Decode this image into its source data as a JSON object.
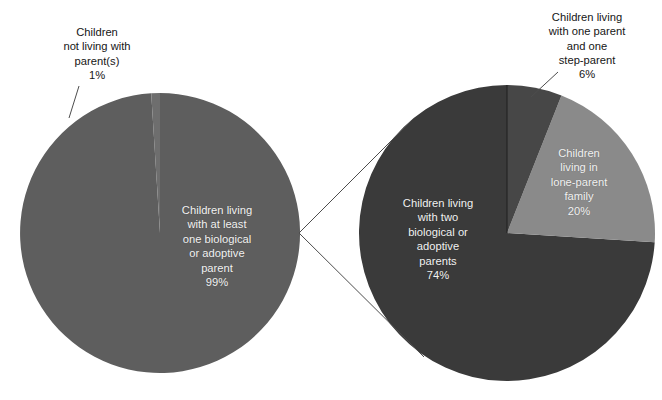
{
  "chart_data": {
    "type": "pie",
    "title": "",
    "subtitle": "",
    "xlabel": "",
    "ylabel": "",
    "legend": "none",
    "grid": false,
    "charts": [
      {
        "name": "left-pie",
        "center": [
          160,
          233
        ],
        "radius": 140,
        "slices": [
          {
            "label": "Children living with at least one biological or adoptive parent",
            "value": 99,
            "value_text": "99%",
            "color": "#5e5e5e",
            "label_position": "inside"
          },
          {
            "label": "Children not living with parent(s)",
            "value": 1,
            "value_text": "1%",
            "color": "#6e6e6e",
            "label_position": "callout"
          }
        ]
      },
      {
        "name": "right-pie",
        "center": [
          507,
          233
        ],
        "radius": 148,
        "slices": [
          {
            "label": "Children living with one parent and one step-parent",
            "value": 6,
            "value_text": "6%",
            "color": "#474747",
            "label_position": "callout"
          },
          {
            "label": "Children living in lone-parent family",
            "value": 20,
            "value_text": "20%",
            "color": "#8a8a8a",
            "label_position": "inside"
          },
          {
            "label": "Children living with two biological or adoptive parents",
            "value": 74,
            "value_text": "74%",
            "color": "#3a3a3a",
            "label_position": "inside"
          }
        ]
      }
    ]
  },
  "callouts": {
    "left_not_living": "Children\nnot living with\nparent(s)\n1%",
    "right_step_parent": "Children living\nwith one parent\nand one\nstep-parent\n6%"
  },
  "slice_labels": {
    "left_main": "Children living\nwith at least\none biological\nor adoptive\nparent\n99%",
    "right_two_parents": "Children living\nwith two\nbiological or\nadoptive\nparents\n74%",
    "right_lone_parent": "Children\nliving in\nlone-parent\nfamily\n20%"
  },
  "colors": {
    "left_pie_main": "#5e5e5e",
    "left_pie_sliver": "#6e6e6e",
    "right_pie_dark": "#3a3a3a",
    "right_pie_step": "#474747",
    "right_pie_light": "#8a8a8a",
    "leader_line": "#4d4d4d",
    "callout_text": "#161616",
    "slice_text": "#f2f2f2",
    "background": "#ffffff"
  }
}
